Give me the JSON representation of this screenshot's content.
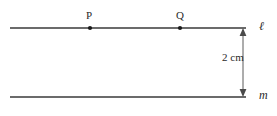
{
  "figure": {
    "kind": "geometry-diagram",
    "background_color": "#ffffff",
    "line_color": "#3a3a3a",
    "dimension_color": "#5a5a5a",
    "point_color": "#1a1a1a",
    "lines": [
      {
        "id": "line-l",
        "label": "ℓ",
        "label_x": 259,
        "label_y": 20,
        "x1": 10,
        "y1": 28,
        "x2": 246,
        "y2": 28
      },
      {
        "id": "line-m",
        "label": "m",
        "label_x": 259,
        "label_y": 89,
        "x1": 10,
        "y1": 97,
        "x2": 246,
        "y2": 97
      }
    ],
    "points": [
      {
        "id": "point-P",
        "label": "P",
        "x": 90,
        "y": 28,
        "label_x": 86,
        "label_y": 10
      },
      {
        "id": "point-Q",
        "label": "Q",
        "x": 180,
        "y": 28,
        "label_x": 176,
        "label_y": 10
      }
    ],
    "dimension": {
      "id": "distance-2cm",
      "label": "2 cm",
      "value": 2,
      "unit": "cm",
      "x": 243,
      "y_top": 28,
      "y_bottom": 97,
      "label_x": 222,
      "label_y": 52,
      "arrow_top": "up",
      "arrow_bottom": "down"
    }
  }
}
